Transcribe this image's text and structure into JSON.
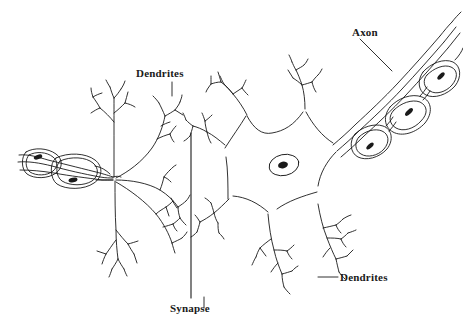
{
  "figure": {
    "background_color": "#ffffff",
    "stroke_color": "#1a1a1a",
    "width": 463,
    "height": 326
  },
  "labels": {
    "dendrites_top": "Dendrites",
    "axon": "Axon",
    "dendrites_right": "Dendrites",
    "synapse": "Synapse"
  },
  "structures": {
    "left_neuron": {
      "name": "presynaptic neuron",
      "myelinated_axon_terminal": "myelinated axon with Schwann cell nuclei",
      "dendritic_tree": "branching dendrites"
    },
    "right_neuron": {
      "name": "postsynaptic neuron",
      "soma": "star-shaped cell body",
      "nucleus": "nucleus with nucleolus",
      "axon": "myelinated axon extending upper right",
      "dendritic_trees": "four branching dendrites"
    },
    "synapse_boundary": "vertical divider line between the two neurons"
  }
}
